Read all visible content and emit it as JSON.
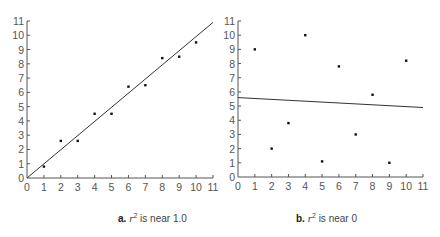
{
  "chart_data": [
    {
      "type": "scatter",
      "title": "",
      "caption": {
        "letter": "a.",
        "var": "r",
        "exp": "2",
        "text": " is near 1.0"
      },
      "xlabel": "",
      "ylabel": "",
      "xlim": [
        0,
        11
      ],
      "ylim": [
        0,
        11
      ],
      "xticks": [
        0,
        1,
        2,
        3,
        4,
        5,
        6,
        7,
        8,
        9,
        10,
        11
      ],
      "yticks": [
        0,
        1,
        2,
        3,
        4,
        5,
        6,
        7,
        8,
        9,
        10,
        11
      ],
      "grid": false,
      "points": [
        [
          1,
          0.8
        ],
        [
          2,
          2.6
        ],
        [
          3,
          2.6
        ],
        [
          4,
          4.5
        ],
        [
          5,
          4.5
        ],
        [
          6,
          6.4
        ],
        [
          7,
          6.5
        ],
        [
          8,
          8.4
        ],
        [
          9,
          8.5
        ],
        [
          10,
          9.5
        ]
      ],
      "fit_line": {
        "x": [
          0,
          11
        ],
        "y": [
          0,
          10.9
        ]
      }
    },
    {
      "type": "scatter",
      "title": "",
      "caption": {
        "letter": "b.",
        "var": "r",
        "exp": "2",
        "text": " is near 0"
      },
      "xlabel": "",
      "ylabel": "",
      "xlim": [
        0,
        11
      ],
      "ylim": [
        0,
        11
      ],
      "xticks": [
        0,
        1,
        2,
        3,
        4,
        5,
        6,
        7,
        8,
        9,
        10,
        11
      ],
      "yticks": [
        0,
        1,
        2,
        3,
        4,
        5,
        6,
        7,
        8,
        9,
        10,
        11
      ],
      "grid": false,
      "points": [
        [
          1,
          9
        ],
        [
          2,
          2
        ],
        [
          3,
          3.8
        ],
        [
          4,
          10
        ],
        [
          5,
          1.1
        ],
        [
          6,
          7.8
        ],
        [
          7,
          3
        ],
        [
          8,
          5.8
        ],
        [
          9,
          1
        ],
        [
          10,
          8.2
        ]
      ],
      "fit_line": {
        "x": [
          0,
          11
        ],
        "y": [
          5.6,
          4.9
        ]
      }
    }
  ],
  "layout": {
    "panels": [
      {
        "x0": 27,
        "x1": 213,
        "y0": 178,
        "y1": 21
      },
      {
        "x0": 238,
        "x1": 423,
        "y0": 177,
        "y1": 21
      }
    ],
    "captions_left": [
      118,
      296
    ]
  },
  "colors": {
    "axis": "#555555",
    "line": "#333333",
    "point": "#111111"
  }
}
